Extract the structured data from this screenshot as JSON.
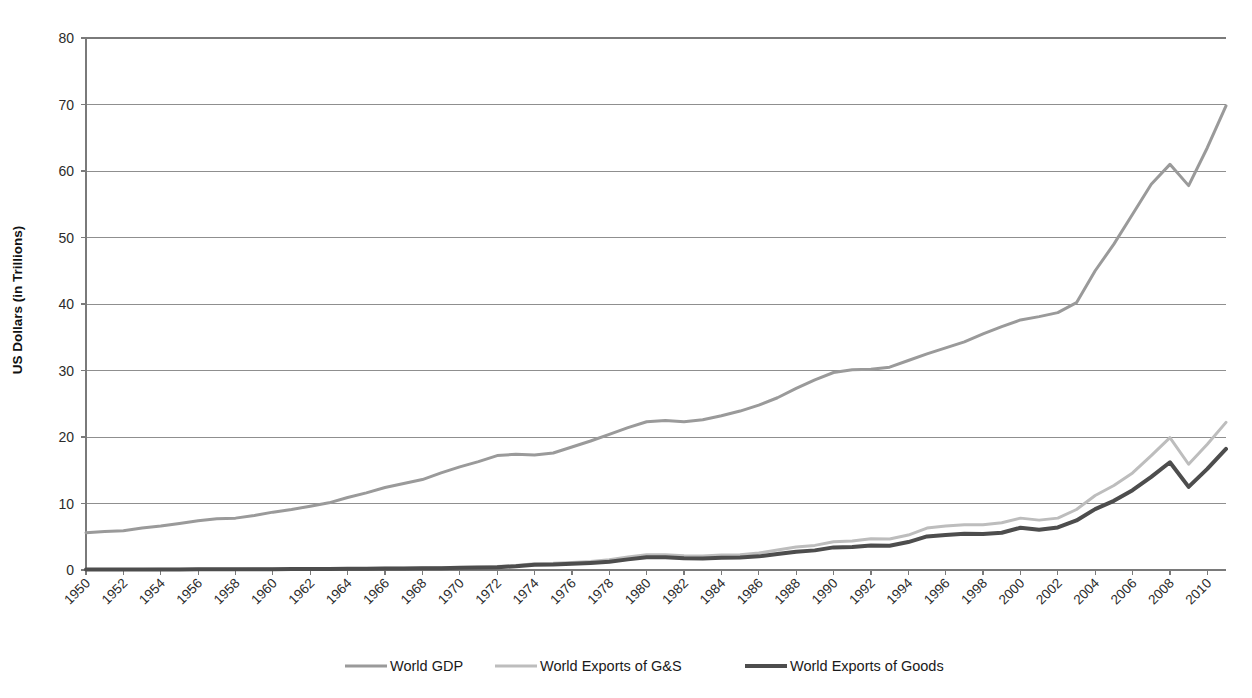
{
  "chart_data": {
    "type": "line",
    "title": "",
    "xlabel": "",
    "ylabel": "US Dollars (in Trillions)",
    "ylim": [
      0,
      80
    ],
    "ytick_step": 10,
    "yticks": [
      0,
      10,
      20,
      30,
      40,
      50,
      60,
      70,
      80
    ],
    "xlim": [
      1950,
      2011
    ],
    "xtick_step": 2,
    "xticks": [
      1950,
      1952,
      1954,
      1956,
      1958,
      1960,
      1962,
      1964,
      1966,
      1968,
      1970,
      1972,
      1974,
      1976,
      1978,
      1980,
      1982,
      1984,
      1986,
      1988,
      1990,
      1992,
      1994,
      1996,
      1998,
      2000,
      2002,
      2004,
      2006,
      2008,
      2010
    ],
    "xtick_rotation": -45,
    "grid": "horizontal",
    "legend_position": "bottom",
    "x": [
      1950,
      1951,
      1952,
      1953,
      1954,
      1955,
      1956,
      1957,
      1958,
      1959,
      1960,
      1961,
      1962,
      1963,
      1964,
      1965,
      1966,
      1967,
      1968,
      1969,
      1970,
      1971,
      1972,
      1973,
      1974,
      1975,
      1976,
      1977,
      1978,
      1979,
      1980,
      1981,
      1982,
      1983,
      1984,
      1985,
      1986,
      1987,
      1988,
      1989,
      1990,
      1991,
      1992,
      1993,
      1994,
      1995,
      1996,
      1997,
      1998,
      1999,
      2000,
      2001,
      2002,
      2003,
      2004,
      2005,
      2006,
      2007,
      2008,
      2009,
      2010,
      2011
    ],
    "series": [
      {
        "name": "World GDP",
        "color": "#9a9a9a",
        "width": 3.0,
        "values": [
          5.6,
          5.8,
          5.9,
          6.3,
          6.6,
          7.0,
          7.4,
          7.7,
          7.8,
          8.2,
          8.7,
          9.1,
          9.6,
          10.1,
          10.9,
          11.6,
          12.4,
          13.0,
          13.6,
          14.6,
          15.5,
          16.3,
          17.2,
          17.4,
          17.3,
          17.6,
          18.5,
          19.4,
          20.4,
          21.4,
          22.3,
          22.5,
          22.3,
          22.6,
          23.2,
          23.9,
          24.8,
          25.9,
          27.3,
          28.6,
          29.7,
          30.1,
          30.2,
          30.5,
          31.5,
          32.5,
          33.4,
          34.3,
          35.5,
          36.6,
          37.6,
          38.1,
          38.7,
          40.2,
          45.0,
          49.0,
          53.5,
          58.0,
          61.0,
          57.8,
          63.5,
          69.8
        ]
      },
      {
        "name": "World Exports of G&S",
        "color": "#bdbdbd",
        "width": 3.0,
        "values": [
          0.07,
          0.09,
          0.09,
          0.09,
          0.1,
          0.11,
          0.12,
          0.13,
          0.13,
          0.14,
          0.15,
          0.16,
          0.17,
          0.19,
          0.21,
          0.23,
          0.25,
          0.27,
          0.3,
          0.34,
          0.39,
          0.43,
          0.51,
          0.68,
          0.95,
          1.0,
          1.12,
          1.28,
          1.53,
          1.94,
          2.3,
          2.28,
          2.16,
          2.12,
          2.25,
          2.3,
          2.55,
          3.0,
          3.45,
          3.7,
          4.25,
          4.35,
          4.7,
          4.65,
          5.25,
          6.3,
          6.6,
          6.8,
          6.8,
          7.1,
          7.8,
          7.5,
          7.8,
          9.1,
          11.2,
          12.7,
          14.6,
          17.2,
          19.9,
          15.9,
          18.9,
          22.2
        ]
      },
      {
        "name": "World Exports of Goods",
        "color": "#4d4d4d",
        "width": 4.0,
        "values": [
          0.06,
          0.08,
          0.08,
          0.08,
          0.08,
          0.09,
          0.1,
          0.11,
          0.11,
          0.12,
          0.13,
          0.14,
          0.15,
          0.16,
          0.18,
          0.19,
          0.21,
          0.22,
          0.25,
          0.28,
          0.32,
          0.36,
          0.42,
          0.56,
          0.8,
          0.83,
          0.93,
          1.06,
          1.25,
          1.6,
          1.92,
          1.9,
          1.78,
          1.74,
          1.85,
          1.88,
          2.05,
          2.4,
          2.75,
          2.95,
          3.4,
          3.45,
          3.7,
          3.65,
          4.2,
          5.05,
          5.25,
          5.45,
          5.4,
          5.6,
          6.35,
          6.05,
          6.4,
          7.45,
          9.15,
          10.4,
          12.0,
          14.0,
          16.2,
          12.5,
          15.2,
          18.2
        ]
      }
    ]
  },
  "legend": {
    "items": [
      {
        "label": "World GDP"
      },
      {
        "label": "World Exports of G&S"
      },
      {
        "label": "World Exports of Goods"
      }
    ]
  }
}
